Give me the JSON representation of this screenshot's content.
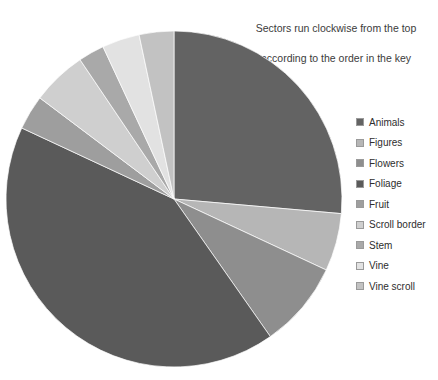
{
  "annotation": {
    "line1": "Sectors run clockwise from the top",
    "line2": "according to the order in the key"
  },
  "legend": {
    "items": [
      {
        "label": "Animals",
        "color": "#636363"
      },
      {
        "label": "Figures",
        "color": "#b6b6b6"
      },
      {
        "label": "Flowers",
        "color": "#8e8e8e"
      },
      {
        "label": "Foliage",
        "color": "#5a5a5a"
      },
      {
        "label": "Fruit",
        "color": "#9e9e9e"
      },
      {
        "label": "Scroll border",
        "color": "#cfcfcf"
      },
      {
        "label": "Stem",
        "color": "#a9a9a9"
      },
      {
        "label": "Vine",
        "color": "#e2e2e2"
      },
      {
        "label": "Vine scroll",
        "color": "#c2c2c2"
      }
    ]
  },
  "chart_data": {
    "type": "pie",
    "title": "",
    "subtitle": "",
    "xlabel": "",
    "ylabel": "",
    "legend_position": "right",
    "grid": false,
    "start_angle_deg": 0,
    "direction": "clockwise",
    "center": {
      "x": 174,
      "y": 199
    },
    "radius": 168,
    "units": "percent",
    "categories": [
      "Animals",
      "Figures",
      "Flowers",
      "Foliage",
      "Fruit",
      "Scroll border",
      "Stem",
      "Vine",
      "Vine scroll"
    ],
    "values": [
      26.4,
      5.6,
      8.3,
      41.7,
      3.3,
      5.3,
      2.5,
      3.6,
      3.3
    ],
    "colors": [
      "#636363",
      "#b6b6b6",
      "#8e8e8e",
      "#5a5a5a",
      "#9e9e9e",
      "#cfcfcf",
      "#a9a9a9",
      "#e2e2e2",
      "#c2c2c2"
    ],
    "slices": [
      {
        "label": "Animals",
        "value": 26.4,
        "angle_deg": 95.0,
        "color": "#636363"
      },
      {
        "label": "Figures",
        "value": 5.6,
        "angle_deg": 20.0,
        "color": "#b6b6b6"
      },
      {
        "label": "Flowers",
        "value": 8.3,
        "angle_deg": 30.0,
        "color": "#8e8e8e"
      },
      {
        "label": "Foliage",
        "value": 41.7,
        "angle_deg": 150.0,
        "color": "#5a5a5a"
      },
      {
        "label": "Fruit",
        "value": 3.3,
        "angle_deg": 12.0,
        "color": "#9e9e9e"
      },
      {
        "label": "Scroll border",
        "value": 5.3,
        "angle_deg": 19.0,
        "color": "#cfcfcf"
      },
      {
        "label": "Stem",
        "value": 2.5,
        "angle_deg": 9.0,
        "color": "#a9a9a9"
      },
      {
        "label": "Vine",
        "value": 3.6,
        "angle_deg": 13.0,
        "color": "#e2e2e2"
      },
      {
        "label": "Vine scroll",
        "value": 3.3,
        "angle_deg": 12.0,
        "color": "#c2c2c2"
      }
    ]
  }
}
